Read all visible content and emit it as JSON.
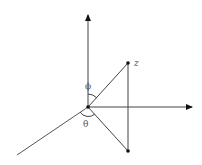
{
  "diagram": {
    "labels": {
      "point": "z",
      "polar_angle": "ϕ",
      "azimuth_angle": "θ"
    },
    "colors": {
      "line": "#444444",
      "arrow": "#111111",
      "label": "#555555"
    }
  }
}
